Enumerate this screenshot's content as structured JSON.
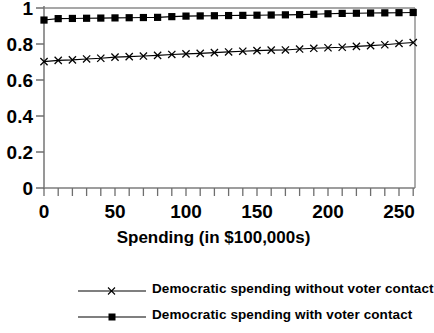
{
  "chart_data": {
    "type": "line",
    "title": "",
    "xlabel": "Spending (in $100,000s)",
    "ylabel": "",
    "xlim": [
      0,
      262
    ],
    "ylim": [
      0,
      1
    ],
    "grid": false,
    "legend_position": "bottom",
    "x_ticks_major": [
      0,
      50,
      100,
      150,
      200,
      250
    ],
    "x_tick_labels": [
      "0",
      "50",
      "100",
      "150",
      "200",
      "250"
    ],
    "x_ticks_minor_step": 10,
    "y_ticks": [
      0,
      0.2,
      0.4,
      0.6,
      0.8,
      1
    ],
    "y_tick_labels": [
      "0",
      "0.2",
      "0.4",
      "0.6",
      "0.8",
      "1"
    ],
    "x": [
      0,
      10,
      20,
      30,
      40,
      50,
      60,
      70,
      80,
      90,
      100,
      110,
      120,
      130,
      140,
      150,
      160,
      170,
      180,
      190,
      200,
      210,
      220,
      230,
      240,
      250,
      260
    ],
    "series": [
      {
        "name": "Democratic spending without voter contact",
        "marker": "x",
        "color": "#000000",
        "values": [
          0.702,
          0.709,
          0.712,
          0.717,
          0.721,
          0.727,
          0.73,
          0.733,
          0.737,
          0.742,
          0.745,
          0.748,
          0.752,
          0.756,
          0.76,
          0.763,
          0.766,
          0.767,
          0.772,
          0.776,
          0.779,
          0.782,
          0.787,
          0.791,
          0.796,
          0.803,
          0.808
        ]
      },
      {
        "name": "Democratic spending with voter contact",
        "marker": "square",
        "color": "#000000",
        "values": [
          0.933,
          0.941,
          0.942,
          0.943,
          0.944,
          0.945,
          0.946,
          0.947,
          0.948,
          0.952,
          0.955,
          0.956,
          0.957,
          0.958,
          0.959,
          0.96,
          0.961,
          0.962,
          0.963,
          0.965,
          0.968,
          0.97,
          0.971,
          0.972,
          0.973,
          0.974,
          0.975
        ]
      }
    ]
  },
  "legend": {
    "items": [
      {
        "label": "Democratic spending without voter contact",
        "marker": "x-marker"
      },
      {
        "label": "Democratic spending with voter contact",
        "marker": "square-marker"
      }
    ]
  },
  "axis": {
    "x_label": "Spending (in $100,000s)"
  }
}
